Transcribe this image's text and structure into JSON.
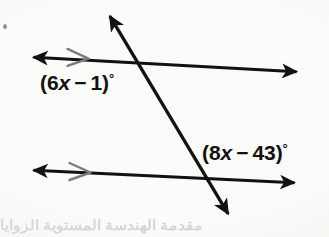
{
  "figure": {
    "kind": "geometry-diagram",
    "background_color": "#fbfbf9",
    "stroke_color": "#121212",
    "tick_mark_color": "#777777",
    "label_color": "#111111"
  },
  "labels": {
    "upper_angle": {
      "open_paren": "(",
      "coefficient": "6",
      "variable": "x",
      "operator": " − ",
      "constant": "1",
      "close_paren": ")",
      "degree": "°",
      "full_text": "(6x − 1)°"
    },
    "lower_angle": {
      "open_paren": "(",
      "coefficient": "8",
      "variable": "x",
      "operator": " − ",
      "constant": "43",
      "close_paren": ")",
      "degree": "°",
      "full_text": "(8x − 43)°"
    }
  },
  "geometry": {
    "upper_parallel_line": {
      "x1": 28,
      "y1": 57,
      "x2": 302,
      "y2": 72
    },
    "lower_parallel_line": {
      "x1": 28,
      "y1": 170,
      "x2": 300,
      "y2": 183
    },
    "transversal_line": {
      "x1": 105,
      "y1": 8,
      "x2": 233,
      "y2": 222
    },
    "intersection_upper": {
      "x": 140,
      "y": 65
    },
    "intersection_lower": {
      "x": 205,
      "y": 180
    },
    "parallel_tick_upper": {
      "x": 78,
      "y": 58
    },
    "parallel_tick_lower": {
      "x": 80,
      "y": 172
    }
  },
  "artifacts": {
    "bottom_ghost_text": "مقدمة  الهندسة  المستوية  الزوايا",
    "edge_speck": "scan-speck"
  }
}
